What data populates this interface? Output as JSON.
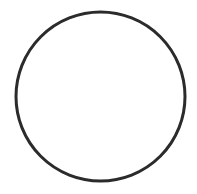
{
  "diagram": {
    "shapes": [
      {
        "type": "circle",
        "cx": 100.5,
        "cy": 96.5,
        "r": 84.5,
        "stroke": "#2b2b2b",
        "stroke_width": 3,
        "fill": "#ffffff"
      }
    ]
  }
}
